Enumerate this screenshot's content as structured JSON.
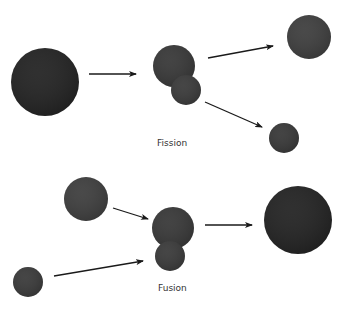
{
  "diagram": {
    "colors": {
      "nucleus_dark": "#232323",
      "nucleus_medium": "#3a3a3a",
      "arrow": "#1a1a1a",
      "label": "#333333",
      "background": "#ffffff"
    },
    "fission": {
      "label": "Fission",
      "label_pos": [
        157,
        138
      ],
      "nuclei": [
        {
          "name": "parent-nucleus",
          "cx": 45,
          "cy": 82,
          "r": 34,
          "fill": "#232323"
        },
        {
          "name": "splitting-nucleus-large",
          "cx": 174,
          "cy": 66,
          "r": 21,
          "fill": "#383838"
        },
        {
          "name": "splitting-nucleus-small",
          "cx": 186,
          "cy": 90,
          "r": 15,
          "fill": "#3a3a3a"
        },
        {
          "name": "daughter-nucleus-large",
          "cx": 309,
          "cy": 37,
          "r": 22,
          "fill": "#3e3e3e"
        },
        {
          "name": "daughter-nucleus-small",
          "cx": 284,
          "cy": 138,
          "r": 15,
          "fill": "#383838"
        }
      ],
      "arrows": [
        {
          "name": "fission-arrow-1",
          "x1": 89,
          "y1": 74,
          "x2": 136,
          "y2": 74
        },
        {
          "name": "fission-arrow-2",
          "x1": 208,
          "y1": 58,
          "x2": 273,
          "y2": 46
        },
        {
          "name": "fission-arrow-3",
          "x1": 205,
          "y1": 102,
          "x2": 262,
          "y2": 127
        }
      ]
    },
    "fusion": {
      "label": "Fusion",
      "label_pos": [
        158,
        283
      ],
      "nuclei": [
        {
          "name": "reactant-nucleus-large",
          "cx": 86,
          "cy": 199,
          "r": 22,
          "fill": "#3e3e3e"
        },
        {
          "name": "reactant-nucleus-small",
          "cx": 28,
          "cy": 282,
          "r": 15,
          "fill": "#3a3a3a"
        },
        {
          "name": "fusing-nucleus-large",
          "cx": 173,
          "cy": 228,
          "r": 21,
          "fill": "#383838"
        },
        {
          "name": "fusing-nucleus-small",
          "cx": 170,
          "cy": 256,
          "r": 15,
          "fill": "#3a3a3a"
        },
        {
          "name": "product-nucleus",
          "cx": 298,
          "cy": 220,
          "r": 34,
          "fill": "#232323"
        }
      ],
      "arrows": [
        {
          "name": "fusion-arrow-1",
          "x1": 113,
          "y1": 208,
          "x2": 148,
          "y2": 219
        },
        {
          "name": "fusion-arrow-2",
          "x1": 54,
          "y1": 276,
          "x2": 143,
          "y2": 261
        },
        {
          "name": "fusion-arrow-3",
          "x1": 205,
          "y1": 225,
          "x2": 252,
          "y2": 225
        }
      ]
    }
  }
}
